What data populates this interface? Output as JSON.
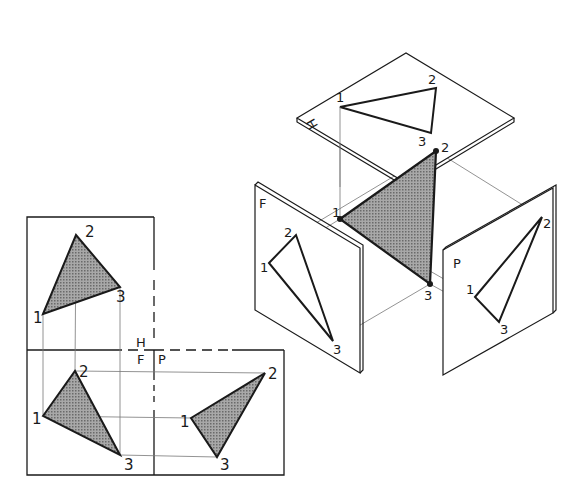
{
  "figure": {
    "colors": {
      "ink": "#1a1a1a",
      "shade": "#8c8c8c",
      "paper": "#ffffff",
      "thin": "#777777"
    }
  },
  "orthographic": {
    "plane_labels": {
      "horizontal": "H",
      "frontal": "F",
      "profile": "P"
    },
    "top_view": {
      "points": [
        {
          "label": "1",
          "x": 43,
          "y": 314
        },
        {
          "label": "2",
          "x": 76,
          "y": 235
        },
        {
          "label": "3",
          "x": 120,
          "y": 287
        }
      ]
    },
    "front_view": {
      "points": [
        {
          "label": "1",
          "x": 43,
          "y": 416
        },
        {
          "label": "2",
          "x": 75,
          "y": 371
        },
        {
          "label": "3",
          "x": 120,
          "y": 455
        }
      ]
    },
    "side_view": {
      "points": [
        {
          "label": "1",
          "x": 191,
          "y": 418
        },
        {
          "label": "2",
          "x": 265,
          "y": 373
        },
        {
          "label": "3",
          "x": 217,
          "y": 457
        }
      ]
    }
  },
  "pictorial": {
    "plane_labels": {
      "horizontal": "H",
      "frontal": "F",
      "profile": "P"
    },
    "space_triangle": {
      "points": [
        {
          "label": "1",
          "x": 340,
          "y": 219
        },
        {
          "label": "2",
          "x": 436,
          "y": 151
        },
        {
          "label": "3",
          "x": 430,
          "y": 284
        }
      ]
    },
    "h_projection": {
      "points": [
        {
          "label": "1",
          "x": 340,
          "y": 107
        },
        {
          "label": "2",
          "x": 436,
          "y": 88
        },
        {
          "label": "3",
          "x": 431,
          "y": 133
        }
      ]
    },
    "f_projection": {
      "points": [
        {
          "label": "1",
          "x": 269,
          "y": 263
        },
        {
          "label": "2",
          "x": 296,
          "y": 235
        },
        {
          "label": "3",
          "x": 333,
          "y": 341
        }
      ]
    },
    "p_projection": {
      "points": [
        {
          "label": "1",
          "x": 475,
          "y": 297
        },
        {
          "label": "2",
          "x": 542,
          "y": 217
        },
        {
          "label": "3",
          "x": 499,
          "y": 322
        }
      ]
    }
  }
}
